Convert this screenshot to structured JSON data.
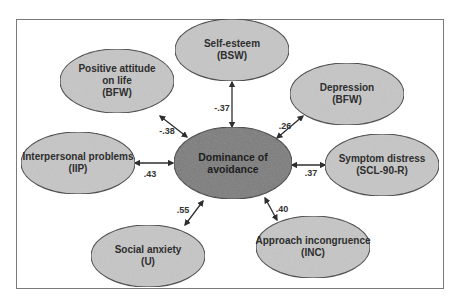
{
  "diagram": {
    "colors": {
      "outer_fill": "#c6c6c6",
      "center_fill": "#7b7b7b",
      "stroke": "#3a3a3a",
      "frame": "#7a7a7a",
      "text": "#2e2e2e"
    },
    "center": {
      "id": "dominance",
      "line1": "Dominance of",
      "line2": "avoidance",
      "cx": 233,
      "cy": 163,
      "rx": 59,
      "ry": 36
    },
    "nodes": [
      {
        "id": "self-esteem",
        "lines": [
          "Self-esteem",
          "(BSW)"
        ],
        "cx": 232,
        "cy": 50,
        "rx": 57,
        "ry": 31,
        "coef": "-.37",
        "coef_x": 222,
        "coef_y": 108,
        "arrow": [
          232,
          82,
          232,
          127
        ]
      },
      {
        "id": "positive-attitude",
        "lines": [
          "Positive attitude",
          "on life",
          "(BFW)"
        ],
        "cx": 117,
        "cy": 81,
        "rx": 57,
        "ry": 32,
        "coef": "-.38",
        "coef_x": 167,
        "coef_y": 131,
        "arrow": [
          160,
          116,
          187,
          137
        ]
      },
      {
        "id": "depression",
        "lines": [
          "Depression",
          "(BFW)"
        ],
        "cx": 347,
        "cy": 94,
        "rx": 57,
        "ry": 31,
        "coef": ".26",
        "coef_x": 285,
        "coef_y": 126,
        "arrow": [
          303,
          116,
          277,
          138
        ]
      },
      {
        "id": "interpersonal-problems",
        "lines": [
          "Interpersonal problems",
          "(IIP)"
        ],
        "cx": 78,
        "cy": 163,
        "rx": 57,
        "ry": 31,
        "coef": ".43",
        "coef_x": 150,
        "coef_y": 174,
        "arrow": [
          135,
          163,
          173,
          163
        ]
      },
      {
        "id": "symptom-distress",
        "lines": [
          "Symptom distress",
          "(SCL-90-R)"
        ],
        "cx": 382,
        "cy": 165,
        "rx": 57,
        "ry": 31,
        "coef": ".37",
        "coef_x": 311,
        "coef_y": 173,
        "arrow": [
          292,
          165,
          325,
          165
        ]
      },
      {
        "id": "social-anxiety",
        "lines": [
          "Social anxiety",
          "(U)"
        ],
        "cx": 148,
        "cy": 256,
        "rx": 57,
        "ry": 31,
        "coef": ".55",
        "coef_x": 183,
        "coef_y": 210,
        "arrow": [
          185,
          225,
          203,
          201
        ]
      },
      {
        "id": "approach-incongruence",
        "lines": [
          "Approach incongruence",
          "(INC)"
        ],
        "cx": 313,
        "cy": 247,
        "rx": 57,
        "ry": 31,
        "coef": ".40",
        "coef_x": 282,
        "coef_y": 209,
        "arrow": [
          265,
          198,
          277,
          220
        ]
      }
    ]
  }
}
